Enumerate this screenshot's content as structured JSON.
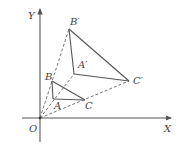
{
  "diagram": {
    "type": "coordinate-geometry-dilation",
    "axes": {
      "x_label": "X",
      "y_label": "Y",
      "origin_label": "O",
      "origin": [
        40,
        118
      ],
      "x_end": [
        171,
        118
      ],
      "y_end": [
        40,
        9
      ]
    },
    "points": {
      "O": {
        "label": "O",
        "xy": [
          40,
          118
        ],
        "label_xy": [
          29,
          132
        ]
      },
      "A": {
        "label": "A",
        "xy": [
          53,
          99
        ],
        "label_xy": [
          54,
          109
        ]
      },
      "B": {
        "label": "B",
        "xy": [
          52,
          81
        ],
        "label_xy": [
          45,
          80
        ]
      },
      "C": {
        "label": "C",
        "xy": [
          85,
          100
        ],
        "label_xy": [
          85,
          109
        ]
      },
      "A_prime": {
        "label": "A′",
        "xy": [
          74,
          74
        ],
        "label_xy": [
          78,
          68
        ]
      },
      "B_prime": {
        "label": "B′",
        "xy": [
          69,
          29
        ],
        "label_xy": [
          70,
          25
        ]
      },
      "C_prime": {
        "label": "C′",
        "xy": [
          129,
          81
        ],
        "label_xy": [
          133,
          84
        ]
      }
    },
    "solid_segments": [
      [
        "A",
        "B"
      ],
      [
        "B",
        "C"
      ],
      [
        "C",
        "A"
      ],
      [
        "A_prime",
        "B_prime"
      ],
      [
        "B_prime",
        "C_prime"
      ],
      [
        "C_prime",
        "A_prime"
      ]
    ],
    "dashed_segments": [
      [
        "O",
        "B_prime"
      ],
      [
        "O",
        "A_prime"
      ],
      [
        "O",
        "C_prime"
      ]
    ],
    "colors": {
      "line": "#555555",
      "text": "#444444",
      "background": "#ffffff"
    }
  }
}
